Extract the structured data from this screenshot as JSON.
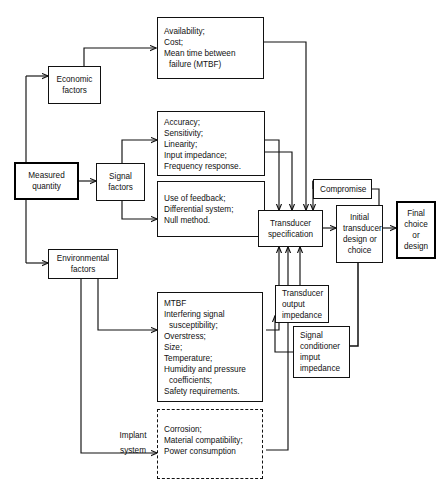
{
  "diagram": {
    "nodes": {
      "measured_quantity": {
        "lines": [
          "Measured",
          "quantity"
        ]
      },
      "economic_factors": {
        "lines": [
          "Economic",
          "factors"
        ]
      },
      "signal_factors": {
        "lines": [
          "Signal",
          "factors"
        ]
      },
      "environmental_factors": {
        "lines": [
          "Environmental",
          "factors"
        ]
      },
      "economic_list": {
        "lines": [
          "Availability;",
          "Cost;",
          "Mean time between",
          "failure (MTBF)"
        ],
        "indent": [
          false,
          false,
          false,
          true
        ]
      },
      "signal_list_a": {
        "lines": [
          "Accuracy;",
          "Sensitivity;",
          "Linearity;",
          "Input impedance;",
          "Frequency response."
        ],
        "indent": [
          false,
          false,
          false,
          false,
          false
        ]
      },
      "signal_list_b": {
        "lines": [
          "Use of feedback;",
          "Differential system;",
          "Null method."
        ],
        "indent": [
          false,
          false,
          false
        ]
      },
      "environment_list": {
        "lines": [
          "MTBF",
          "Interfering signal",
          "susceptibility;",
          "Overstress;",
          "Size;",
          "Temperature;",
          "Humidity and pressure",
          "coefficients;",
          "Safety requirements."
        ],
        "indent": [
          false,
          false,
          true,
          false,
          false,
          false,
          false,
          true,
          false
        ]
      },
      "implant_list": {
        "lines": [
          "Corrosion;",
          "Material compatibility;",
          "Power consumption"
        ],
        "indent": [
          false,
          false,
          false
        ]
      },
      "transducer_specification": {
        "lines": [
          "Transducer",
          "specification"
        ]
      },
      "compromise": {
        "lines": [
          "Compromise"
        ]
      },
      "initial_design": {
        "lines": [
          "Initial",
          "transducer",
          "design or",
          "choice"
        ]
      },
      "final_choice": {
        "lines": [
          "Final",
          "choice",
          "or",
          "design"
        ]
      },
      "transducer_output_impedance": {
        "lines": [
          "Transducer",
          "output",
          "impedance"
        ]
      },
      "signal_conditioner_input_impedance": {
        "lines": [
          "Signal",
          "conditioner",
          "imput",
          "impedance"
        ]
      }
    },
    "edge_labels": {
      "implant_system": {
        "lines": [
          "Implant",
          "system"
        ]
      }
    },
    "colors": {
      "stroke": "#111111",
      "background": "#ffffff",
      "emphasis_border": "#000000"
    }
  }
}
